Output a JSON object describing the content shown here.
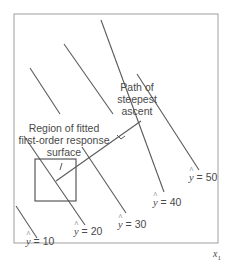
{
  "diagram": {
    "axis": {
      "x_label": "x",
      "x_subscript": "1"
    },
    "annotations": {
      "region": [
        "Region of fitted",
        "first-order response",
        "surface"
      ],
      "path": [
        "Path of",
        "steepest",
        "ascent"
      ]
    },
    "contours": [
      {
        "var": "y",
        "eq": "= 10"
      },
      {
        "var": "y",
        "eq": "= 20"
      },
      {
        "var": "y",
        "eq": "= 30"
      },
      {
        "var": "y",
        "eq": "= 40"
      },
      {
        "var": "y",
        "eq": "= 50"
      }
    ],
    "colors": {
      "line": "#5a5a5a",
      "frame": "#9a9a9a",
      "text": "#4a4a4a"
    }
  }
}
